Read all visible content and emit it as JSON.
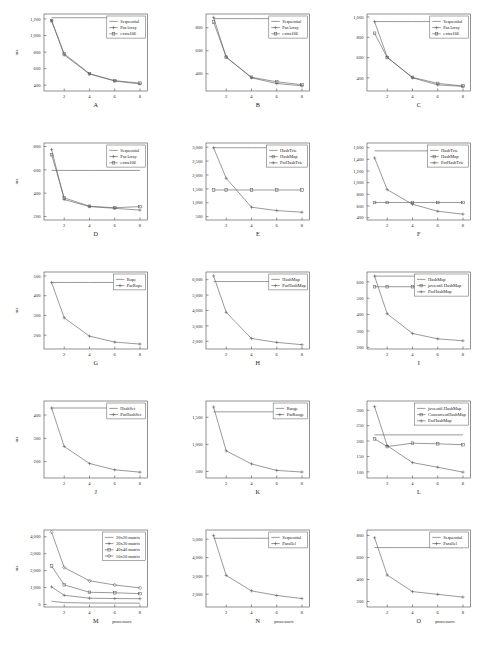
{
  "figure": {
    "layout": "3 columns x 5 rows",
    "x_axis_label": "processors",
    "y_axis_label": "ms",
    "x_ticks": [
      2,
      4,
      6,
      8
    ],
    "x_range": [
      0.4,
      8.6
    ]
  },
  "chart_data": [
    {
      "id": "A",
      "type": "line",
      "title": "A",
      "xlabel": "",
      "ylabel": "ms",
      "x": [
        1,
        2,
        4,
        6,
        8
      ],
      "xlim": [
        0.4,
        8.6
      ],
      "ylim": [
        330,
        1260
      ],
      "yticks": [
        400,
        600,
        800,
        1000,
        1200
      ],
      "yticklabels": [
        "400",
        "600",
        "800",
        "1,000",
        "1,200"
      ],
      "legend_position": "top-right",
      "grid": false,
      "series": [
        {
          "name": "Sequential",
          "values": [
            1215,
            1215,
            1215,
            1215,
            1215
          ],
          "marker": "none"
        },
        {
          "name": "ParArray",
          "values": [
            1180,
            765,
            535,
            450,
            415
          ],
          "marker": "plus"
        },
        {
          "name": "extra166",
          "values": [
            1180,
            780,
            540,
            455,
            425
          ],
          "marker": "square"
        }
      ]
    },
    {
      "id": "B",
      "type": "line",
      "title": "B",
      "xlabel": "",
      "ylabel": "",
      "x": [
        1,
        2,
        4,
        6,
        8
      ],
      "xlim": [
        0.4,
        8.6
      ],
      "ylim": [
        250,
        920
      ],
      "yticks": [
        400,
        600,
        800
      ],
      "yticklabels": [
        "400",
        "600",
        "800"
      ],
      "legend_position": "top-right",
      "grid": false,
      "series": [
        {
          "name": "Sequential",
          "values": [
            880,
            880,
            880,
            880,
            880
          ],
          "marker": "none"
        },
        {
          "name": "ParArray",
          "values": [
            890,
            545,
            365,
            315,
            295
          ],
          "marker": "plus"
        },
        {
          "name": "extra166",
          "values": [
            850,
            545,
            370,
            330,
            305
          ],
          "marker": "square"
        }
      ]
    },
    {
      "id": "C",
      "type": "line",
      "title": "C",
      "xlabel": "",
      "ylabel": "",
      "x": [
        1,
        2,
        4,
        6,
        8
      ],
      "xlim": [
        0.4,
        8.6
      ],
      "ylim": [
        270,
        1030
      ],
      "yticks": [
        400,
        600,
        800,
        1000
      ],
      "yticklabels": [
        "400",
        "600",
        "800",
        "1,000"
      ],
      "legend_position": "top-right",
      "grid": false,
      "series": [
        {
          "name": "Sequential",
          "values": [
            955,
            955,
            955,
            955,
            955
          ],
          "marker": "none"
        },
        {
          "name": "ParArray",
          "values": [
            955,
            605,
            400,
            330,
            315
          ],
          "marker": "plus"
        },
        {
          "name": "extra166",
          "values": [
            840,
            600,
            405,
            345,
            320
          ],
          "marker": "square"
        }
      ]
    },
    {
      "id": "D",
      "type": "line",
      "title": "D",
      "xlabel": "",
      "ylabel": "ms",
      "x": [
        1,
        2,
        4,
        6,
        8
      ],
      "xlim": [
        0.4,
        8.6
      ],
      "ylim": [
        170,
        830
      ],
      "yticks": [
        200,
        400,
        600,
        800
      ],
      "yticklabels": [
        "200",
        "400",
        "600",
        "800"
      ],
      "legend_position": "top-right",
      "grid": false,
      "series": [
        {
          "name": "Sequential",
          "values": [
            595,
            595,
            595,
            595,
            595
          ],
          "marker": "none"
        },
        {
          "name": "ParArray",
          "values": [
            775,
            345,
            285,
            270,
            255
          ],
          "marker": "plus"
        },
        {
          "name": "extra166",
          "values": [
            730,
            360,
            288,
            275,
            285
          ],
          "marker": "square"
        }
      ]
    },
    {
      "id": "E",
      "type": "line",
      "title": "E",
      "xlabel": "",
      "ylabel": "",
      "x": [
        1,
        2,
        4,
        6,
        8
      ],
      "xlim": [
        0.4,
        8.6
      ],
      "ylim": [
        380,
        3150
      ],
      "yticks": [
        500,
        1000,
        1500,
        2000,
        2500,
        3000
      ],
      "yticklabels": [
        "500",
        "1,000",
        "1,500",
        "2,000",
        "2,500",
        "3,000"
      ],
      "legend_position": "top-right",
      "grid": false,
      "series": [
        {
          "name": "HashTrie",
          "values": [
            2980,
            2980,
            2980,
            2980,
            2980
          ],
          "marker": "none"
        },
        {
          "name": "HashMap",
          "values": [
            1460,
            1460,
            1460,
            1460,
            1460
          ],
          "marker": "square"
        },
        {
          "name": "ParHashTrie",
          "values": [
            2980,
            1880,
            840,
            720,
            660
          ],
          "marker": "plus"
        }
      ]
    },
    {
      "id": "F",
      "type": "line",
      "title": "F",
      "xlabel": "",
      "ylabel": "",
      "x": [
        1,
        2,
        4,
        6,
        8
      ],
      "xlim": [
        0.4,
        8.6
      ],
      "ylim": [
        360,
        1680
      ],
      "yticks": [
        400,
        600,
        800,
        1000,
        1200,
        1400,
        1600
      ],
      "yticklabels": [
        "400",
        "600",
        "800",
        "1,000",
        "1,200",
        "1,400",
        "1,600"
      ],
      "legend_position": "top-right",
      "grid": false,
      "series": [
        {
          "name": "HashTrie",
          "values": [
            1545,
            1545,
            1545,
            1545,
            1545
          ],
          "marker": "none"
        },
        {
          "name": "HashMap",
          "values": [
            660,
            660,
            660,
            660,
            660
          ],
          "marker": "square"
        },
        {
          "name": "ParHashTrie",
          "values": [
            1425,
            880,
            630,
            510,
            460
          ],
          "marker": "plus"
        }
      ]
    },
    {
      "id": "G",
      "type": "line",
      "title": "G",
      "xlabel": "",
      "ylabel": "ms",
      "x": [
        1,
        2,
        4,
        6,
        8
      ],
      "xlim": [
        0.4,
        8.6
      ],
      "ylim": [
        130,
        520
      ],
      "yticks": [
        200,
        300,
        400,
        500
      ],
      "yticklabels": [
        "200",
        "300",
        "400",
        "500"
      ],
      "legend_position": "top-right",
      "grid": false,
      "series": [
        {
          "name": "Rope",
          "values": [
            467,
            467,
            467,
            467,
            467
          ],
          "marker": "none"
        },
        {
          "name": "ParRope",
          "values": [
            467,
            288,
            195,
            165,
            155
          ],
          "marker": "plus"
        }
      ]
    },
    {
      "id": "H",
      "type": "line",
      "title": "H",
      "xlabel": "",
      "ylabel": "",
      "x": [
        1,
        2,
        4,
        6,
        8
      ],
      "xlim": [
        0.4,
        8.6
      ],
      "ylim": [
        1500,
        6500
      ],
      "yticks": [
        2000,
        3000,
        4000,
        5000,
        6000
      ],
      "yticklabels": [
        "2,000",
        "3,000",
        "4,000",
        "5,000",
        "6,000"
      ],
      "legend_position": "top-right",
      "grid": false,
      "series": [
        {
          "name": "HashMap",
          "values": [
            5880,
            5880,
            5880,
            5880,
            5880
          ],
          "marker": "none"
        },
        {
          "name": "ParHashMap",
          "values": [
            6250,
            3880,
            2180,
            1930,
            1780
          ],
          "marker": "plus"
        }
      ]
    },
    {
      "id": "I",
      "type": "line",
      "title": "I",
      "xlabel": "",
      "ylabel": "",
      "x": [
        1,
        2,
        4,
        6,
        8
      ],
      "xlim": [
        0.4,
        8.6
      ],
      "ylim": [
        190,
        660
      ],
      "yticks": [
        200,
        300,
        400,
        500,
        600
      ],
      "yticklabels": [
        "200",
        "300",
        "400",
        "500",
        "600"
      ],
      "legend_position": "top-right",
      "grid": false,
      "series": [
        {
          "name": "HashMap",
          "values": [
            635,
            635,
            635,
            635,
            635
          ],
          "marker": "none"
        },
        {
          "name": "java.util.HashMap",
          "values": [
            570,
            570,
            570,
            570,
            570
          ],
          "marker": "square"
        },
        {
          "name": "ParHashMap",
          "values": [
            635,
            405,
            285,
            252,
            240
          ],
          "marker": "plus"
        }
      ]
    },
    {
      "id": "J",
      "type": "line",
      "title": "J",
      "xlabel": "",
      "ylabel": "ms",
      "x": [
        1,
        2,
        4,
        6,
        8
      ],
      "xlim": [
        0.4,
        8.6
      ],
      "ylim": [
        130,
        460
      ],
      "yticks": [
        200,
        300,
        400
      ],
      "yticklabels": [
        "200",
        "300",
        "400"
      ],
      "legend_position": "top-right",
      "grid": false,
      "series": [
        {
          "name": "HashSet",
          "values": [
            430,
            430,
            430,
            430,
            430
          ],
          "marker": "none"
        },
        {
          "name": "ParHashSet",
          "values": [
            430,
            265,
            192,
            165,
            155
          ],
          "marker": "plus"
        }
      ]
    },
    {
      "id": "K",
      "type": "line",
      "title": "K",
      "xlabel": "",
      "ylabel": "",
      "x": [
        1,
        2,
        4,
        6,
        8
      ],
      "xlim": [
        0.4,
        8.6
      ],
      "ylim": [
        380,
        1800
      ],
      "yticks": [
        500,
        1000,
        1500
      ],
      "yticklabels": [
        "500",
        "1,000",
        "1,500"
      ],
      "legend_position": "top-right",
      "grid": false,
      "series": [
        {
          "name": "Range",
          "values": [
            1600,
            1600,
            1600,
            1600,
            1600
          ],
          "marker": "none"
        },
        {
          "name": "ParRange",
          "values": [
            1690,
            880,
            640,
            520,
            490
          ],
          "marker": "plus"
        }
      ]
    },
    {
      "id": "L",
      "type": "line",
      "title": "L",
      "xlabel": "",
      "ylabel": "",
      "x": [
        1,
        2,
        4,
        6,
        8
      ],
      "xlim": [
        0.4,
        8.6
      ],
      "ylim": [
        80,
        330
      ],
      "yticks": [
        100,
        150,
        200,
        250,
        300
      ],
      "yticklabels": [
        "100",
        "150",
        "200",
        "250",
        "300"
      ],
      "legend_position": "top-right",
      "grid": false,
      "series": [
        {
          "name": "java.util.HashMap",
          "values": [
            220,
            220,
            220,
            220,
            220
          ],
          "marker": "none"
        },
        {
          "name": "ConcurrentHashMap",
          "values": [
            207,
            182,
            193,
            191,
            188
          ],
          "marker": "square"
        },
        {
          "name": "ParHashMap",
          "values": [
            312,
            185,
            130,
            115,
            99
          ],
          "marker": "plus"
        }
      ]
    },
    {
      "id": "M",
      "type": "line",
      "title": "M",
      "xlabel": "processors",
      "ylabel": "ms",
      "x": [
        1,
        2,
        4,
        6,
        8
      ],
      "xlim": [
        0.4,
        8.6
      ],
      "ylim": [
        -150,
        4400
      ],
      "yticks": [
        0,
        1000,
        2000,
        3000,
        4000
      ],
      "yticklabels": [
        "0",
        "1,000",
        "2,000",
        "3,000",
        "4,000"
      ],
      "legend_position": "top-right",
      "grid": false,
      "series": [
        {
          "name": "20x20 matrix",
          "values": [
            190,
            110,
            85,
            80,
            78
          ],
          "marker": "none"
        },
        {
          "name": "30x30 matrix",
          "values": [
            1040,
            540,
            370,
            350,
            340
          ],
          "marker": "plus"
        },
        {
          "name": "40x40 matrix",
          "values": [
            2270,
            1160,
            720,
            690,
            640
          ],
          "marker": "square"
        },
        {
          "name": "50x50 matrix",
          "values": [
            4270,
            2180,
            1400,
            1150,
            980
          ],
          "marker": "diamond"
        }
      ]
    },
    {
      "id": "N",
      "type": "line",
      "title": "N",
      "xlabel": "processors",
      "ylabel": "",
      "x": [
        1,
        2,
        4,
        6,
        8
      ],
      "xlim": [
        0.4,
        8.6
      ],
      "ylim": [
        1300,
        5500
      ],
      "yticks": [
        2000,
        3000,
        4000,
        5000
      ],
      "yticklabels": [
        "2,000",
        "3,000",
        "4,000",
        "5,000"
      ],
      "legend_position": "top-right",
      "grid": false,
      "series": [
        {
          "name": "Sequential",
          "values": [
            5050,
            5050,
            5050,
            5050,
            5050
          ],
          "marker": "none"
        },
        {
          "name": "Parallel",
          "values": [
            5200,
            3020,
            2180,
            1930,
            1760
          ],
          "marker": "plus"
        }
      ]
    },
    {
      "id": "O",
      "type": "line",
      "title": "O",
      "xlabel": "processors",
      "ylabel": "",
      "x": [
        1,
        2,
        4,
        6,
        8
      ],
      "xlim": [
        0.4,
        8.6
      ],
      "ylim": [
        150,
        850
      ],
      "yticks": [
        200,
        400,
        600,
        800
      ],
      "yticklabels": [
        "200",
        "400",
        "600",
        "800"
      ],
      "legend_position": "top-right",
      "grid": false,
      "series": [
        {
          "name": "Sequential",
          "values": [
            690,
            690,
            690,
            690,
            690
          ],
          "marker": "none"
        },
        {
          "name": "Parallel",
          "values": [
            780,
            440,
            290,
            265,
            240
          ],
          "marker": "plus"
        }
      ]
    }
  ]
}
